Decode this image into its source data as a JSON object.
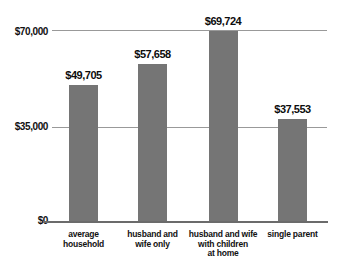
{
  "chart_data": {
    "type": "bar",
    "title": "",
    "categories": [
      "average\nhousehold",
      "husband and\nwife only",
      "husband and wife\nwith children\nat home",
      "single parent"
    ],
    "values": [
      49705,
      57658,
      69724,
      37553
    ],
    "value_labels": [
      "$49,705",
      "$57,658",
      "$69,724",
      "$37,553"
    ],
    "y_ticks": [
      {
        "value": 0,
        "label": "$0"
      },
      {
        "value": 35000,
        "label": "$35,000"
      },
      {
        "value": 70000,
        "label": "$70,000"
      }
    ],
    "ylim": [
      0,
      70000
    ],
    "grid": true,
    "legend": "none",
    "xlabel": "",
    "ylabel": "",
    "bar_color": "#757575",
    "gridline_color": "#999999",
    "axis_color": "#6b6b6b",
    "text_color": "#111111",
    "background_color": "#ffffff"
  }
}
